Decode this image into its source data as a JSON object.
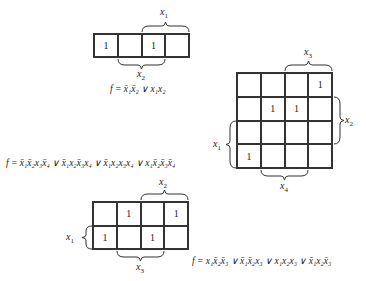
{
  "map1": {
    "rows": 1,
    "cols": 4,
    "cells": [
      [
        "1",
        "",
        "1",
        ""
      ]
    ],
    "labels": {
      "top": "x1",
      "bottom": "x2"
    },
    "equation": "f = x̄₁x̄₂ ∨ x₁x₂"
  },
  "map2": {
    "rows": 4,
    "cols": 4,
    "cells": [
      [
        "",
        "",
        "",
        "1"
      ],
      [
        "",
        "1",
        "1",
        ""
      ],
      [
        "",
        "",
        "",
        ""
      ],
      [
        "1",
        "",
        "",
        ""
      ]
    ],
    "labels": {
      "top": "x3",
      "right": "x2",
      "left": "x1",
      "bottom": "x4"
    },
    "equation": "f = x̄₁x̄₂x₃x̄₄ ∨ x̄₁x₂x̄₃x₄ ∨ x̄₁x₂x₃x₄ ∨ x₁x̄₂x̄₃x̄₄"
  },
  "map3": {
    "rows": 2,
    "cols": 4,
    "cells": [
      [
        "",
        "1",
        "",
        "1"
      ],
      [
        "1",
        "",
        "1",
        ""
      ]
    ],
    "labels": {
      "top": "x2",
      "left": "x1",
      "bottom": "x3"
    },
    "equation": "f = x₁x̄₂x̄₃ ∨ x̄₁x̄₂x₃ ∨ x₁x₂x₃ ∨ x̄₁x₂x̄₃"
  }
}
